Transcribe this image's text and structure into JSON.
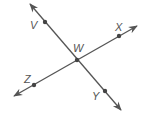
{
  "diagram": {
    "type": "geometry-intersecting-lines",
    "stroke_color": "#555555",
    "point_color": "#444444",
    "lines": [
      {
        "name": "line-VY",
        "from": [
          30,
          4
        ],
        "to": [
          121,
          110
        ],
        "points": [
          "V",
          "W",
          "Y"
        ]
      },
      {
        "name": "line-ZX",
        "from": [
          14,
          96
        ],
        "to": [
          137,
          26
        ],
        "points": [
          "Z",
          "W",
          "X"
        ]
      }
    ],
    "points": [
      {
        "label": "V",
        "x": 45,
        "y": 22,
        "lx": 30,
        "ly": 29
      },
      {
        "label": "X",
        "x": 119,
        "y": 36,
        "lx": 115,
        "ly": 31
      },
      {
        "label": "W",
        "x": 77,
        "y": 60,
        "lx": 73,
        "ly": 52
      },
      {
        "label": "Z",
        "x": 34,
        "y": 85,
        "lx": 24,
        "ly": 83
      },
      {
        "label": "Y",
        "x": 105,
        "y": 91,
        "lx": 92,
        "ly": 100
      }
    ]
  }
}
